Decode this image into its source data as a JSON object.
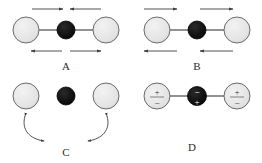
{
  "figure": {
    "background_color": "#ffffff",
    "width": 262,
    "height": 163
  },
  "style": {
    "light_atom_fill": "#e3e3e3",
    "light_atom_stroke": "#6b6b6b",
    "dark_atom_fill": "#111111",
    "dark_atom_stroke": "#000000",
    "bond_color": "#3a3a3a",
    "arrow_color": "#404040",
    "label_color": "#2b2b2b"
  },
  "panels": [
    {
      "id": "A",
      "label": "A",
      "description": "symmetric-stretch-mode",
      "atoms": [
        {
          "name": "left-light-atom",
          "type": "light",
          "cx": 26,
          "cy": 30,
          "r": 13
        },
        {
          "name": "center-dark-atom",
          "type": "dark",
          "cx": 66,
          "cy": 30,
          "r": 9
        },
        {
          "name": "right-light-atom",
          "type": "light",
          "cx": 106,
          "cy": 30,
          "r": 13
        }
      ],
      "bonds": [
        {
          "name": "left-bond",
          "x1": 39,
          "y1": 30,
          "x2": 57,
          "y2": 30
        },
        {
          "name": "right-bond",
          "x1": 75,
          "y1": 30,
          "x2": 93,
          "y2": 30
        }
      ],
      "arrows": [
        {
          "name": "top-left-arrow",
          "direction": "right",
          "x1": 32,
          "y1": 9,
          "x2": 63,
          "y2": 9
        },
        {
          "name": "top-right-arrow",
          "direction": "left",
          "x1": 101,
          "y1": 9,
          "x2": 70,
          "y2": 9
        },
        {
          "name": "bottom-left-arrow",
          "direction": "left",
          "x1": 62,
          "y1": 51,
          "x2": 31,
          "y2": 51
        },
        {
          "name": "bottom-right-arrow",
          "direction": "right",
          "x1": 70,
          "y1": 51,
          "x2": 101,
          "y2": 51
        }
      ]
    },
    {
      "id": "B",
      "label": "B",
      "description": "asymmetric-stretch-mode",
      "atoms": [
        {
          "name": "left-light-atom",
          "type": "light",
          "cx": 157,
          "cy": 30,
          "r": 13
        },
        {
          "name": "center-dark-atom",
          "type": "dark",
          "cx": 197,
          "cy": 30,
          "r": 9
        },
        {
          "name": "right-light-atom",
          "type": "light",
          "cx": 237,
          "cy": 30,
          "r": 13
        }
      ],
      "bonds": [
        {
          "name": "left-bond",
          "x1": 170,
          "y1": 30,
          "x2": 188,
          "y2": 30
        },
        {
          "name": "right-bond",
          "x1": 206,
          "y1": 30,
          "x2": 224,
          "y2": 30
        }
      ],
      "arrows": [
        {
          "name": "top-left-arrow",
          "direction": "right",
          "x1": 144,
          "y1": 9,
          "x2": 177,
          "y2": 9
        },
        {
          "name": "top-right-arrow",
          "direction": "right",
          "x1": 200,
          "y1": 9,
          "x2": 233,
          "y2": 9
        },
        {
          "name": "bottom-left-arrow",
          "direction": "left",
          "x1": 177,
          "y1": 51,
          "x2": 144,
          "y2": 51
        },
        {
          "name": "bottom-right-arrow",
          "direction": "left",
          "x1": 233,
          "y1": 51,
          "x2": 200,
          "y2": 51
        }
      ]
    },
    {
      "id": "C",
      "label": "C",
      "description": "bending-mode",
      "atoms": [
        {
          "name": "left-light-atom",
          "type": "light",
          "cx": 26,
          "cy": 96,
          "r": 13
        },
        {
          "name": "center-dark-atom",
          "type": "dark",
          "cx": 66,
          "cy": 96,
          "r": 9
        },
        {
          "name": "right-light-atom",
          "type": "light",
          "cx": 106,
          "cy": 96,
          "r": 13
        }
      ],
      "bonds": [],
      "curved_arrows": [
        {
          "name": "left-curved-double-arrow",
          "path": "M 25 116 C 22 131 31 139 44 141"
        },
        {
          "name": "right-curved-double-arrow",
          "path": "M 107 116 C 110 131 101 139 88 141"
        }
      ]
    },
    {
      "id": "D",
      "label": "D",
      "description": "charge-dipole-representation",
      "atoms": [
        {
          "name": "left-light-atom",
          "type": "light",
          "cx": 157,
          "cy": 96,
          "r": 13,
          "sign_top": "+",
          "sign_bottom": "−"
        },
        {
          "name": "center-dark-atom",
          "type": "dark",
          "cx": 197,
          "cy": 96,
          "r": 9,
          "sign_top": "−",
          "sign_bottom": "+"
        },
        {
          "name": "right-light-atom",
          "type": "light",
          "cx": 237,
          "cy": 96,
          "r": 13,
          "sign_top": "+",
          "sign_bottom": "−"
        }
      ],
      "bonds": [
        {
          "name": "left-bond",
          "x1": 170,
          "y1": 96,
          "x2": 188,
          "y2": 96
        },
        {
          "name": "right-bond",
          "x1": 206,
          "y1": 96,
          "x2": 224,
          "y2": 96
        }
      ]
    }
  ],
  "panel_label_positions": [
    {
      "id": "A",
      "x": 66,
      "y": 70
    },
    {
      "id": "B",
      "x": 197,
      "y": 70
    },
    {
      "id": "C",
      "x": 66,
      "y": 155
    },
    {
      "id": "D",
      "x": 192,
      "y": 150
    }
  ]
}
